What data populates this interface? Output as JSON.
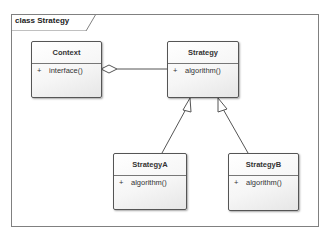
{
  "frame": {
    "title": "class Strategy"
  },
  "classes": {
    "context": {
      "name": "Context",
      "operations": [
        {
          "visibility": "+",
          "name": "interface()"
        }
      ]
    },
    "strategy": {
      "name": "Strategy",
      "operations": [
        {
          "visibility": "+",
          "name": "algorithm()"
        }
      ]
    },
    "strategyA": {
      "name": "StrategyA",
      "operations": [
        {
          "visibility": "+",
          "name": "algorithm()"
        }
      ]
    },
    "strategyB": {
      "name": "StrategyB",
      "operations": [
        {
          "visibility": "+",
          "name": "algorithm()"
        }
      ]
    }
  },
  "relationships": [
    {
      "type": "aggregation",
      "from": "Context",
      "to": "Strategy"
    },
    {
      "type": "generalization",
      "from": "StrategyA",
      "to": "Strategy"
    },
    {
      "type": "generalization",
      "from": "StrategyB",
      "to": "Strategy"
    }
  ],
  "colors": {
    "border": "#555555",
    "frame": "#808080",
    "text": "#333333"
  }
}
